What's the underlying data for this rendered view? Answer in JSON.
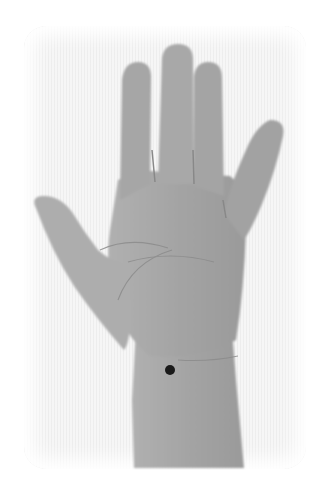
{
  "image": {
    "subject": "open hand, palm facing viewer",
    "marker": {
      "label": "acupressure point on wrist",
      "x": 170,
      "y": 370,
      "radius": 5,
      "color": "#1a1a1a"
    },
    "colors": {
      "background": "#ffffff",
      "panel": "#f6f6f6",
      "skin": "#a8a8a8",
      "skin_dark": "#8e8e8e",
      "crease": "#7a7a7a"
    }
  }
}
